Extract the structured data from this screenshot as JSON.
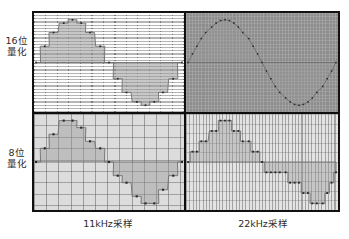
{
  "figure": {
    "title_implicit": "Sampling rate and quantization comparison",
    "row_labels": [
      {
        "id": "16bit",
        "line1": "16位",
        "line2": "量化"
      },
      {
        "id": "8bit",
        "line1": "8位",
        "line2": "量化"
      }
    ],
    "column_labels": [
      {
        "id": "11khz",
        "text": "11kHz采样"
      },
      {
        "id": "22khz",
        "text": "22kHz采样"
      }
    ],
    "colors": {
      "frame": "#111111",
      "page_background": "#ffffff",
      "text": "#2b2b2b",
      "panel_16_11_bg": "#cfcfcf",
      "panel_16_22_bg": "#8d8d8d",
      "panel_8_11_bg": "#dcdcdc",
      "panel_8_22_bg": "#e3e3e3",
      "waveform_fill": "#9a9a9a",
      "sample_point": "#262626"
    }
  },
  "chart_data": [
    {
      "id": "panel-16-11",
      "type": "line",
      "title": "16位量化 / 11kHz采样",
      "row": "16位量化",
      "column": "11kHz采样",
      "quantization_bits": 16,
      "sampling_rate_khz": 11,
      "xlabel": "",
      "ylabel": "",
      "ylim": [
        -1,
        1
      ],
      "xlim": [
        0,
        1
      ],
      "grid": "dense-horizontal-coarse-vertical",
      "legend": "none",
      "annotation": "Fine amplitude steps (16-bit) but coarse time steps (11kHz): visibly stepped sine",
      "x": [
        0.0,
        0.06,
        0.12,
        0.19,
        0.25,
        0.31,
        0.37,
        0.44,
        0.5,
        0.56,
        0.62,
        0.69,
        0.75,
        0.81,
        0.87,
        0.94,
        1.0
      ],
      "values": [
        0.0,
        0.38,
        0.7,
        0.92,
        1.0,
        0.92,
        0.7,
        0.38,
        0.0,
        -0.38,
        -0.7,
        -0.92,
        -1.0,
        -0.92,
        -0.7,
        -0.38,
        0.0
      ]
    },
    {
      "id": "panel-16-22",
      "type": "line",
      "title": "16位量化 / 22kHz采样",
      "row": "16位量化",
      "column": "22kHz采样",
      "quantization_bits": 16,
      "sampling_rate_khz": 22,
      "xlabel": "",
      "ylabel": "",
      "ylim": [
        -1,
        1
      ],
      "xlim": [
        0,
        1
      ],
      "grid": "fine-dotted",
      "legend": "none",
      "annotation": "Fine amplitude and fine time steps: smooth sine curve, best fidelity",
      "x": [
        0.0,
        0.03,
        0.06,
        0.09,
        0.12,
        0.16,
        0.19,
        0.22,
        0.25,
        0.28,
        0.31,
        0.34,
        0.37,
        0.41,
        0.44,
        0.47,
        0.5,
        0.53,
        0.56,
        0.59,
        0.62,
        0.66,
        0.69,
        0.72,
        0.75,
        0.78,
        0.81,
        0.84,
        0.87,
        0.91,
        0.94,
        0.97,
        1.0
      ],
      "values": [
        0.0,
        0.2,
        0.38,
        0.56,
        0.7,
        0.83,
        0.92,
        0.98,
        1.0,
        0.98,
        0.92,
        0.83,
        0.7,
        0.56,
        0.38,
        0.2,
        0.0,
        -0.2,
        -0.38,
        -0.56,
        -0.7,
        -0.83,
        -0.92,
        -0.98,
        -1.0,
        -0.98,
        -0.92,
        -0.83,
        -0.7,
        -0.56,
        -0.38,
        -0.2,
        0.0
      ]
    },
    {
      "id": "panel-8-11",
      "type": "line",
      "title": "8位量化 / 11kHz采样",
      "row": "8位量化",
      "column": "11kHz采样",
      "quantization_bits": 8,
      "sampling_rate_khz": 11,
      "xlabel": "",
      "ylabel": "",
      "ylim": [
        -1,
        1
      ],
      "xlim": [
        0,
        1
      ],
      "grid": "coarse-square",
      "legend": "none",
      "annotation": "Coarse amplitude and coarse time steps: blocky staircase, worst fidelity",
      "x": [
        0.0,
        0.06,
        0.12,
        0.19,
        0.25,
        0.31,
        0.37,
        0.44,
        0.5,
        0.56,
        0.62,
        0.69,
        0.75,
        0.81,
        0.87,
        0.94,
        1.0
      ],
      "values": [
        0.0,
        0.33,
        0.67,
        1.0,
        1.0,
        0.83,
        0.5,
        0.33,
        0.0,
        -0.33,
        -0.5,
        -0.83,
        -1.0,
        -1.0,
        -0.67,
        -0.33,
        0.0
      ]
    },
    {
      "id": "panel-8-22",
      "type": "line",
      "title": "8位量化 / 22kHz采样",
      "row": "8位量化",
      "column": "22kHz采样",
      "quantization_bits": 8,
      "sampling_rate_khz": 22,
      "xlabel": "",
      "ylabel": "",
      "ylim": [
        -1,
        1
      ],
      "xlim": [
        0,
        1
      ],
      "grid": "dense-vertical-coarse-horizontal",
      "legend": "none",
      "annotation": "Coarse amplitude steps (8-bit) but fine time steps (22kHz): vertical staircase",
      "x": [
        0.0,
        0.03,
        0.06,
        0.09,
        0.12,
        0.16,
        0.19,
        0.22,
        0.25,
        0.28,
        0.31,
        0.34,
        0.37,
        0.41,
        0.44,
        0.47,
        0.5,
        0.53,
        0.56,
        0.59,
        0.62,
        0.66,
        0.69,
        0.72,
        0.75,
        0.78,
        0.81,
        0.84,
        0.87,
        0.91,
        0.94,
        0.97,
        1.0
      ],
      "values": [
        0.0,
        0.25,
        0.25,
        0.5,
        0.5,
        0.75,
        0.75,
        1.0,
        1.0,
        1.0,
        0.75,
        0.75,
        0.5,
        0.5,
        0.25,
        0.25,
        0.0,
        -0.25,
        -0.25,
        -0.25,
        -0.25,
        -0.25,
        -0.5,
        -0.5,
        -0.5,
        -0.75,
        -0.75,
        -1.0,
        -1.0,
        -1.0,
        -0.75,
        -0.5,
        -0.25
      ]
    }
  ]
}
